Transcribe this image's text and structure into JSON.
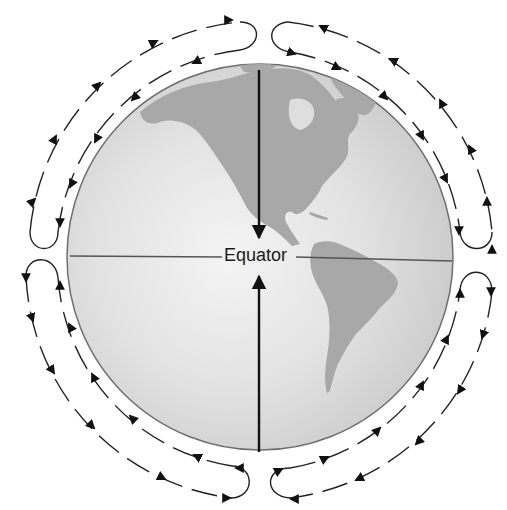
{
  "diagram": {
    "labels": {
      "equator": "Equator"
    },
    "globe": {
      "center": [
        260,
        257
      ],
      "radius": 193,
      "ocean_color": "#dcdcdc",
      "ocean_highlight": "#f2f2f2",
      "land_color": "#a9a9a9",
      "outline_color": "#6e6e6e"
    },
    "arrows": {
      "north_surface_flow": "toward equator (southward)",
      "south_surface_flow": "toward equator (northward)",
      "color": "#111111"
    },
    "circulation_cells": [
      {
        "name": "northern-hemisphere-west-loop",
        "direction": "outer arc poleward, inner arc equatorward"
      },
      {
        "name": "northern-hemisphere-east-loop",
        "direction": "outer arc poleward, inner arc equatorward"
      },
      {
        "name": "southern-hemisphere-west-loop",
        "direction": "outer arc poleward, inner arc equatorward"
      },
      {
        "name": "southern-hemisphere-east-loop",
        "direction": "outer arc poleward, inner arc equatorward"
      }
    ],
    "colors": {
      "background": "#ffffff",
      "line": "#222222",
      "equator_line": "#555555"
    }
  }
}
